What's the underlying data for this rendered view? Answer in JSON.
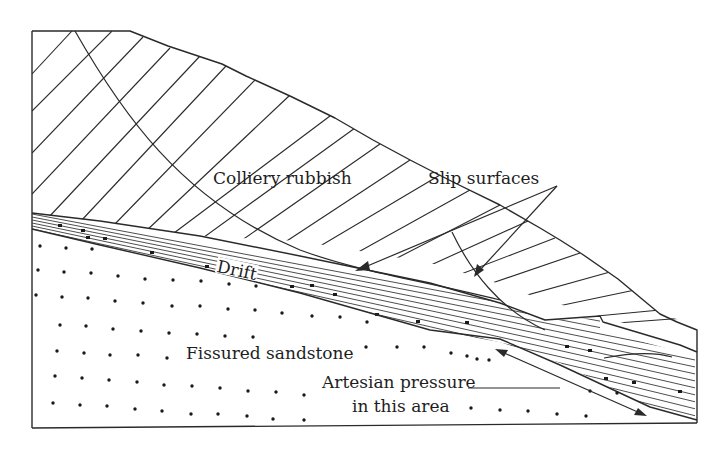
{
  "diagram": {
    "type": "geological cross-section",
    "labels": {
      "colliery_rubbish": "Colliery rubbish",
      "slip_surfaces": "Slip surfaces",
      "drift": "Drift",
      "fissured_sandstone": "Fissured sandstone",
      "artesian_line1": "Artesian pressure",
      "artesian_line2": "in this area"
    },
    "layers": [
      {
        "name": "Colliery rubbish",
        "pattern": "diagonal-hatch"
      },
      {
        "name": "Drift",
        "pattern": "horizontal-lines-with-stones"
      },
      {
        "name": "Fissured sandstone",
        "pattern": "dots"
      }
    ],
    "annotations": [
      {
        "text": "Slip surfaces",
        "arrows": 2
      },
      {
        "text": "Artesian pressure in this area",
        "arrows": "double-headed along bedrock surface"
      }
    ],
    "colors": {
      "line": "#2a2a2a",
      "background": "#ffffff"
    }
  }
}
